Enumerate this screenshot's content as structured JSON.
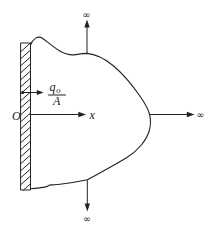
{
  "figure": {
    "colors": {
      "ink": "#222222",
      "background": "#ffffff"
    },
    "labels": {
      "origin": "O",
      "x_axis": "x",
      "flux_q": "q",
      "flux_q_sub": "o",
      "flux_denominator": "A",
      "infinity_top": "∞",
      "infinity_right": "∞",
      "infinity_bottom": "∞"
    }
  }
}
